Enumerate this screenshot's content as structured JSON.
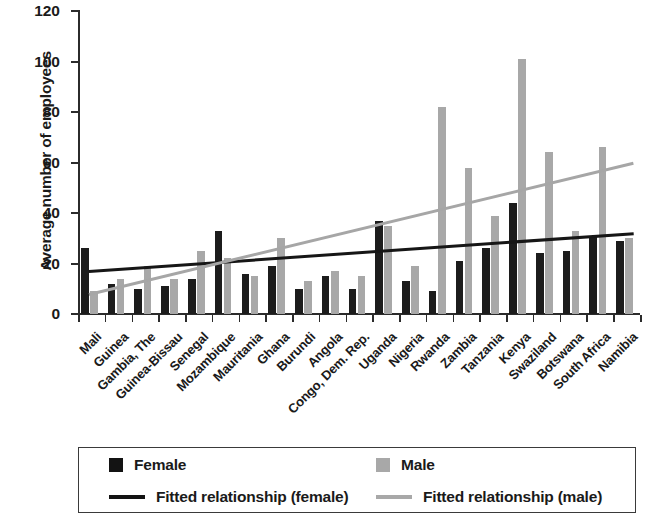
{
  "chart_data": {
    "type": "bar",
    "title": "",
    "xlabel": "",
    "ylabel": "Average number of employees",
    "ylim": [
      0,
      120
    ],
    "yticks": [
      0,
      20,
      40,
      60,
      80,
      100,
      120
    ],
    "grid": false,
    "legend_position": "bottom",
    "categories": [
      "Mali",
      "Guinea",
      "Gambia, The",
      "Guinea-Bissau",
      "Senegal",
      "Mozambique",
      "Mauritania",
      "Ghana",
      "Burundi",
      "Angola",
      "Congo, Dem. Rep.",
      "Uganda",
      "Nigeria",
      "Rwanda",
      "Zambia",
      "Tanzania",
      "Kenya",
      "Swaziland",
      "Botswana",
      "South Africa",
      "Namibia"
    ],
    "series": [
      {
        "name": "Female",
        "color": "#1c1c1c",
        "values": [
          26,
          12,
          10,
          11,
          14,
          33,
          16,
          19,
          10,
          15,
          10,
          37,
          13,
          9,
          21,
          26,
          44,
          24,
          25,
          31,
          29
        ]
      },
      {
        "name": "Male",
        "color": "#a8a8a8",
        "values": [
          9,
          14,
          19,
          14,
          25,
          22,
          15,
          30,
          13,
          17,
          15,
          35,
          19,
          82,
          58,
          39,
          101,
          64,
          33,
          66,
          30
        ]
      }
    ],
    "trendlines": [
      {
        "name": "Fitted relationship (female)",
        "color": "#161616",
        "start_value": 17,
        "end_value": 32
      },
      {
        "name": "Fitted relationship (male)",
        "color": "#a6a6a6",
        "start_value": 8,
        "end_value": 60
      }
    ]
  },
  "legend": {
    "female_label": "Female",
    "male_label": "Male",
    "fitted_female_label": "Fitted relationship (female)",
    "fitted_male_label": "Fitted relationship (male)"
  }
}
